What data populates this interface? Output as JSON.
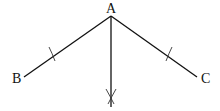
{
  "diagram": {
    "type": "geometric-construction",
    "points": {
      "A": {
        "label": "A",
        "x": 111,
        "y": 16
      },
      "B": {
        "label": "B",
        "x": 24,
        "y": 77
      },
      "C": {
        "label": "C",
        "x": 197,
        "y": 77
      }
    },
    "segments": [
      {
        "from": "A",
        "to": "B"
      },
      {
        "from": "A",
        "to": "C"
      },
      {
        "from": "A",
        "to": "bisector-end"
      }
    ],
    "marks": [
      {
        "type": "arc-tick",
        "on": "AB"
      },
      {
        "type": "arc-tick",
        "on": "AC"
      },
      {
        "type": "arc-intersection",
        "on": "bisector"
      }
    ],
    "line_color": "#111111"
  }
}
